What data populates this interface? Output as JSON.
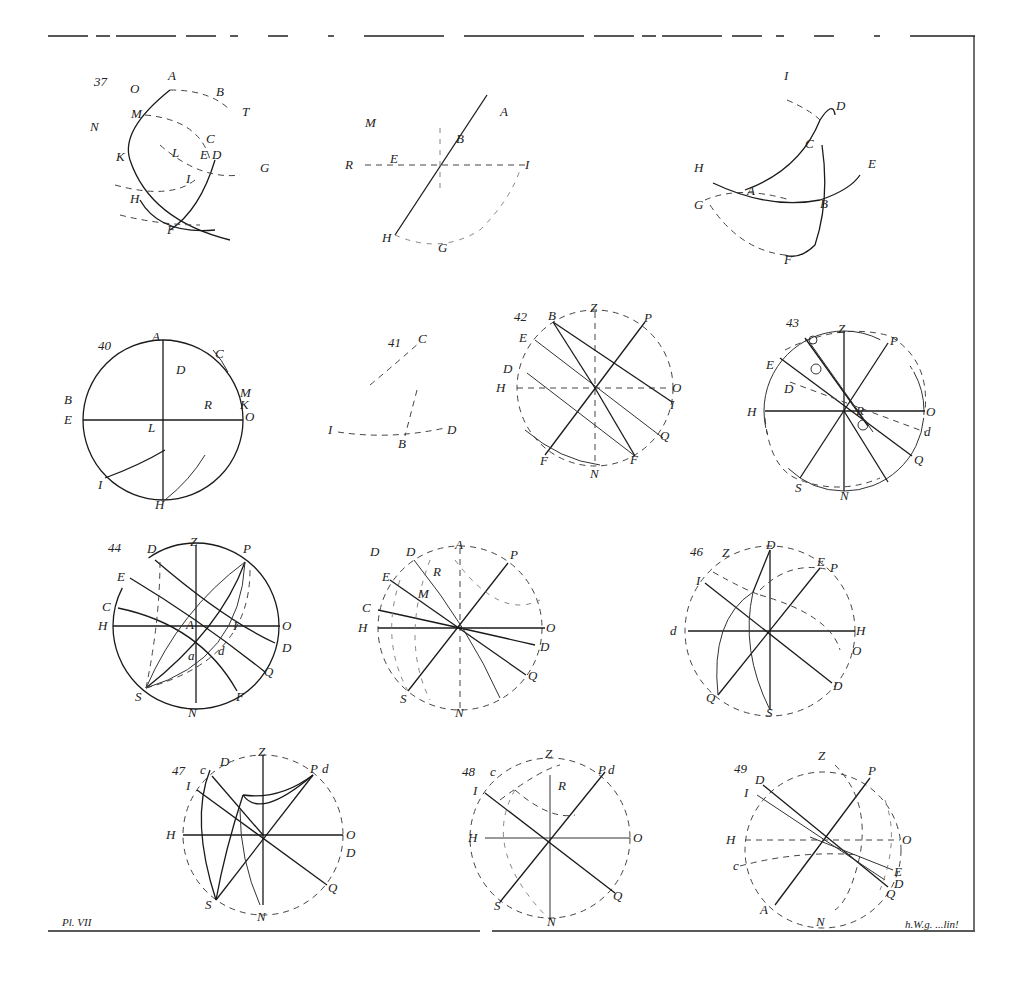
{
  "plate": {
    "label": "Pl. VII",
    "engraver_mark": "h.W.g. ...lin!"
  },
  "figures": [
    {
      "number": "37",
      "labels": [
        "O",
        "A",
        "B",
        "T",
        "M",
        "N",
        "C",
        "E",
        "D",
        "K",
        "L",
        "I",
        "G",
        "H",
        "F"
      ]
    },
    {
      "number": "",
      "labels": [
        "M",
        "A",
        "B",
        "R",
        "E",
        "I",
        "H",
        "G"
      ]
    },
    {
      "number": "",
      "labels": [
        "I",
        "D",
        "C",
        "E",
        "H",
        "A",
        "B",
        "G",
        "F"
      ]
    },
    {
      "number": "40",
      "labels": [
        "A",
        "C",
        "D",
        "B",
        "R",
        "M",
        "K",
        "E",
        "O",
        "L",
        "I",
        "H"
      ]
    },
    {
      "number": "41",
      "labels": [
        "C",
        "I",
        "B",
        "D"
      ]
    },
    {
      "number": "42",
      "labels": [
        "Z",
        "B",
        "P",
        "E",
        "D",
        "H",
        "O",
        "I",
        "Q",
        "F",
        "F",
        "N"
      ]
    },
    {
      "number": "43",
      "labels": [
        "Z",
        "P",
        "E",
        "D",
        "H",
        "O",
        "d",
        "Q",
        "S",
        "N",
        "R"
      ]
    },
    {
      "number": "44",
      "labels": [
        "Z",
        "D",
        "P",
        "E",
        "C",
        "H",
        "A",
        "I",
        "O",
        "D",
        "a",
        "d",
        "Q",
        "S",
        "F",
        "N"
      ]
    },
    {
      "number": "45",
      "labels": [
        "D",
        "D",
        "A",
        "P",
        "E",
        "R",
        "M",
        "C",
        "H",
        "O",
        "D",
        "Q",
        "S",
        "N"
      ]
    },
    {
      "number": "46",
      "labels": [
        "D",
        "Z",
        "I",
        "E",
        "P",
        "d",
        "H",
        "O",
        "D",
        "Q",
        "S",
        "N"
      ]
    },
    {
      "number": "47",
      "labels": [
        "D",
        "Z",
        "P",
        "d",
        "c",
        "I",
        "H",
        "O",
        "D",
        "Q",
        "S",
        "N"
      ]
    },
    {
      "number": "48",
      "labels": [
        "Z",
        "c",
        "R",
        "P",
        "d",
        "I",
        "H",
        "O",
        "Q",
        "S",
        "N"
      ]
    },
    {
      "number": "49",
      "labels": [
        "Z",
        "D",
        "P",
        "I",
        "H",
        "O",
        "c",
        "E",
        "D",
        "Q",
        "A",
        "N"
      ]
    }
  ]
}
